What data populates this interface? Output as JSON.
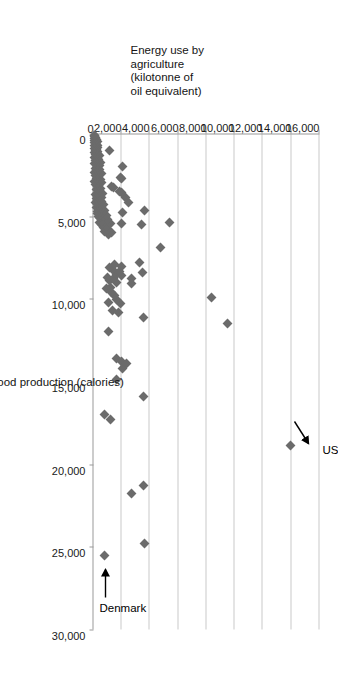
{
  "chart_data": {
    "type": "scatter",
    "title": "",
    "xlabel": "Per capita food production (calories)",
    "ylabel": "Energy use by agriculture (kilotonne of oil equivalent)",
    "ylabel_lines": [
      "Energy use by",
      "agriculture",
      "(kilotonne of",
      "oil equivalent)"
    ],
    "xlim": [
      0,
      30000
    ],
    "ylim": [
      0,
      16000
    ],
    "xticks": [
      0,
      5000,
      10000,
      15000,
      20000,
      25000,
      30000
    ],
    "xtick_labels": [
      "0",
      "5,000",
      "10,000",
      "15,000",
      "20,000",
      "25,000",
      "30,000"
    ],
    "yticks": [
      0,
      2000,
      4000,
      6000,
      8000,
      10000,
      12000,
      14000,
      16000
    ],
    "ytick_labels": [
      "0",
      "2,000",
      "4,000",
      "6,000",
      "8,000",
      "10,000",
      "12,000",
      "14,000",
      "16,000"
    ],
    "grid": "horizontal",
    "legend": "none",
    "marker": {
      "shape": "diamond",
      "color": "#6b6b6b",
      "size_px": 7
    },
    "gridline_color": "#c9c9c9",
    "axis_color": "#9a9a9a",
    "annotations": [
      {
        "label": "US",
        "x": 18900,
        "y": 13950,
        "arrow": "points down-right to marker"
      },
      {
        "label": "Denmark",
        "x": 25500,
        "y": 800,
        "arrow": "points down-left to marker"
      }
    ],
    "points": [
      [
        18900,
        13950
      ],
      [
        11500,
        9500
      ],
      [
        9900,
        8350
      ],
      [
        24800,
        3600
      ],
      [
        21300,
        3550
      ],
      [
        21800,
        2700
      ],
      [
        15900,
        3550
      ],
      [
        11100,
        3550
      ],
      [
        6900,
        4750
      ],
      [
        8400,
        3500
      ],
      [
        7800,
        3250
      ],
      [
        5500,
        3400
      ],
      [
        8800,
        2700
      ],
      [
        9100,
        2700
      ],
      [
        4650,
        3600
      ],
      [
        4200,
        2500
      ],
      [
        5400,
        5350
      ],
      [
        3900,
        2250
      ],
      [
        4750,
        2050
      ],
      [
        5450,
        2000
      ],
      [
        17300,
        1200
      ],
      [
        17000,
        800
      ],
      [
        14900,
        1600
      ],
      [
        14200,
        2050
      ],
      [
        13600,
        1650
      ],
      [
        13800,
        2000
      ],
      [
        13900,
        2350
      ],
      [
        12000,
        1050
      ],
      [
        10700,
        1350
      ],
      [
        10800,
        1750
      ],
      [
        10300,
        1900
      ],
      [
        10050,
        1650
      ],
      [
        10200,
        1050
      ],
      [
        9800,
        1500
      ],
      [
        9600,
        1300
      ],
      [
        9400,
        900
      ],
      [
        9300,
        1200
      ],
      [
        9000,
        1600
      ],
      [
        8900,
        1100
      ],
      [
        8800,
        1450
      ],
      [
        8700,
        1000
      ],
      [
        8600,
        2000
      ],
      [
        8500,
        1600
      ],
      [
        8350,
        1850
      ],
      [
        8200,
        1350
      ],
      [
        8100,
        1150
      ],
      [
        8050,
        2000
      ],
      [
        7900,
        1500
      ],
      [
        6100,
        1050
      ],
      [
        6000,
        1300
      ],
      [
        5950,
        800
      ],
      [
        5800,
        1000
      ],
      [
        5700,
        700
      ],
      [
        5600,
        900
      ],
      [
        5500,
        600
      ],
      [
        5450,
        1200
      ],
      [
        5400,
        450
      ],
      [
        5350,
        800
      ],
      [
        5300,
        550
      ],
      [
        5200,
        1000
      ],
      [
        5100,
        400
      ],
      [
        5050,
        700
      ],
      [
        5000,
        350
      ],
      [
        4950,
        900
      ],
      [
        4900,
        500
      ],
      [
        4850,
        300
      ],
      [
        4800,
        650
      ],
      [
        4750,
        450
      ],
      [
        4700,
        250
      ],
      [
        4650,
        800
      ],
      [
        4600,
        400
      ],
      [
        4550,
        600
      ],
      [
        4500,
        300
      ],
      [
        4450,
        200
      ],
      [
        4400,
        500
      ],
      [
        4350,
        350
      ],
      [
        4300,
        700
      ],
      [
        4250,
        250
      ],
      [
        4200,
        450
      ],
      [
        4150,
        150
      ],
      [
        4100,
        600
      ],
      [
        4050,
        300
      ],
      [
        4000,
        400
      ],
      [
        3950,
        200
      ],
      [
        3900,
        550
      ],
      [
        3850,
        350
      ],
      [
        3800,
        250
      ],
      [
        3750,
        450
      ],
      [
        3700,
        150
      ],
      [
        3650,
        650
      ],
      [
        3600,
        300
      ],
      [
        3550,
        2000
      ],
      [
        3500,
        1850
      ],
      [
        3450,
        400
      ],
      [
        3400,
        200
      ],
      [
        3350,
        500
      ],
      [
        3300,
        250
      ],
      [
        3250,
        1450
      ],
      [
        3200,
        1300
      ],
      [
        3150,
        350
      ],
      [
        3100,
        150
      ],
      [
        3050,
        450
      ],
      [
        3000,
        250
      ],
      [
        2950,
        600
      ],
      [
        2900,
        100
      ],
      [
        2850,
        350
      ],
      [
        2800,
        500
      ],
      [
        2750,
        200
      ],
      [
        2700,
        1950
      ],
      [
        2650,
        1900
      ],
      [
        2600,
        300
      ],
      [
        2550,
        150
      ],
      [
        2500,
        400
      ],
      [
        2450,
        250
      ],
      [
        2400,
        550
      ],
      [
        2350,
        100
      ],
      [
        2300,
        300
      ],
      [
        2250,
        200
      ],
      [
        2200,
        450
      ],
      [
        2150,
        350
      ],
      [
        2100,
        150
      ],
      [
        2050,
        250
      ],
      [
        2000,
        2050
      ],
      [
        1950,
        400
      ],
      [
        1900,
        200
      ],
      [
        1850,
        300
      ],
      [
        1800,
        100
      ],
      [
        1750,
        500
      ],
      [
        1700,
        250
      ],
      [
        1650,
        150
      ],
      [
        1600,
        350
      ],
      [
        1550,
        200
      ],
      [
        1500,
        300
      ],
      [
        1450,
        100
      ],
      [
        1400,
        250
      ],
      [
        1350,
        400
      ],
      [
        1300,
        150
      ],
      [
        1250,
        200
      ],
      [
        1200,
        300
      ],
      [
        1150,
        100
      ],
      [
        1100,
        250
      ],
      [
        1050,
        150
      ],
      [
        1000,
        1150
      ],
      [
        950,
        200
      ],
      [
        900,
        100
      ],
      [
        850,
        300
      ],
      [
        800,
        150
      ],
      [
        750,
        250
      ],
      [
        700,
        100
      ],
      [
        650,
        200
      ],
      [
        600,
        150
      ],
      [
        550,
        100
      ],
      [
        500,
        250
      ],
      [
        450,
        150
      ],
      [
        400,
        100
      ],
      [
        350,
        200
      ],
      [
        300,
        100
      ],
      [
        250,
        150
      ],
      [
        200,
        100
      ],
      [
        150,
        80
      ],
      [
        100,
        60
      ],
      [
        25500,
        800
      ]
    ]
  },
  "annotations": {
    "us_label": "US",
    "denmark_label": "Denmark"
  },
  "axes": {
    "x_title": "Per capita food production (calories)",
    "y_title_line1": "Energy use by",
    "y_title_line2": "agriculture",
    "y_title_line3": "(kilotonne of",
    "y_title_line4": "oil equivalent)"
  }
}
